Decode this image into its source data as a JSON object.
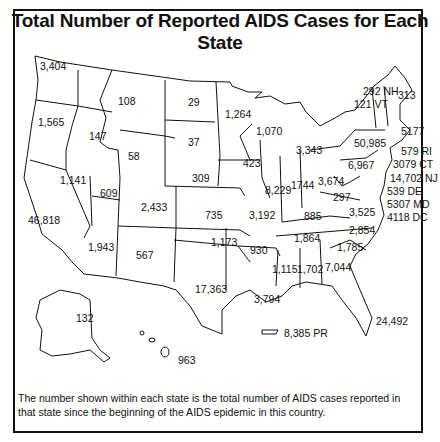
{
  "title": "Total Number of Reported AIDS Cases for Each State",
  "note": "The number shown within each state is the total number of AIDS cases reported in that state since the beginning of the AIDS epidemic in this country.",
  "states": [
    {
      "id": "WA",
      "label": "3,404",
      "x": 40,
      "y": 61
    },
    {
      "id": "OR",
      "label": "1,565",
      "x": 38,
      "y": 117
    },
    {
      "id": "ID",
      "label": "147",
      "x": 89,
      "y": 131
    },
    {
      "id": "MT",
      "label": "108",
      "x": 118,
      "y": 96
    },
    {
      "id": "WY",
      "label": "58",
      "x": 128,
      "y": 151
    },
    {
      "id": "ND",
      "label": "29",
      "x": 188,
      "y": 97
    },
    {
      "id": "SD",
      "label": "37",
      "x": 188,
      "y": 137
    },
    {
      "id": "MN",
      "label": "1,264",
      "x": 225,
      "y": 109
    },
    {
      "id": "WI",
      "label": "1,070",
      "x": 256,
      "y": 126
    },
    {
      "id": "MI",
      "label": "3,343",
      "x": 296,
      "y": 145
    },
    {
      "id": "NV",
      "label": "1,141",
      "x": 60,
      "y": 175
    },
    {
      "id": "UT",
      "label": "609",
      "x": 100,
      "y": 188
    },
    {
      "id": "CO",
      "label": "2,433",
      "x": 141,
      "y": 202
    },
    {
      "id": "NE",
      "label": "309",
      "x": 192,
      "y": 173
    },
    {
      "id": "IA",
      "label": "423",
      "x": 243,
      "y": 158
    },
    {
      "id": "IL",
      "label": "8,229",
      "x": 265,
      "y": 185
    },
    {
      "id": "IN",
      "label": "1744",
      "x": 291,
      "y": 180
    },
    {
      "id": "OH",
      "label": "3,674",
      "x": 318,
      "y": 176
    },
    {
      "id": "PA",
      "label": "6,967",
      "x": 348,
      "y": 160
    },
    {
      "id": "NY",
      "label": "50,985",
      "x": 354,
      "y": 138
    },
    {
      "id": "CA",
      "label": "46,818",
      "x": 28,
      "y": 215
    },
    {
      "id": "KS",
      "label": "735",
      "x": 205,
      "y": 210
    },
    {
      "id": "MO",
      "label": "3,192",
      "x": 249,
      "y": 210
    },
    {
      "id": "KY",
      "label": "885",
      "x": 304,
      "y": 211
    },
    {
      "id": "WV",
      "label": "297",
      "x": 333,
      "y": 192
    },
    {
      "id": "VA",
      "label": "3,525",
      "x": 349,
      "y": 207
    },
    {
      "id": "AZ",
      "label": "1,943",
      "x": 88,
      "y": 242
    },
    {
      "id": "NM",
      "label": "567",
      "x": 136,
      "y": 250
    },
    {
      "id": "OK",
      "label": "1,173",
      "x": 211,
      "y": 237
    },
    {
      "id": "AR",
      "label": "930",
      "x": 250,
      "y": 245
    },
    {
      "id": "TN",
      "label": "1,864",
      "x": 294,
      "y": 233
    },
    {
      "id": "NC",
      "label": "2,854",
      "x": 349,
      "y": 225
    },
    {
      "id": "SC",
      "label": "1,785",
      "x": 337,
      "y": 242
    },
    {
      "id": "TX",
      "label": "17,363",
      "x": 195,
      "y": 284
    },
    {
      "id": "MS",
      "label": "1,115",
      "x": 272,
      "y": 264
    },
    {
      "id": "AL",
      "label": "1,702",
      "x": 297,
      "y": 264
    },
    {
      "id": "GA",
      "label": "7,044",
      "x": 325,
      "y": 262
    },
    {
      "id": "LA",
      "label": "3,794",
      "x": 254,
      "y": 294
    },
    {
      "id": "FL",
      "label": "24,492",
      "x": 376,
      "y": 316
    },
    {
      "id": "AK",
      "label": "132",
      "x": 76,
      "y": 313
    },
    {
      "id": "HI",
      "label": "963",
      "x": 178,
      "y": 355
    },
    {
      "id": "PR",
      "label": "8,385 PR",
      "x": 284,
      "y": 328
    },
    {
      "id": "NH",
      "label": "292 NH",
      "x": 363,
      "y": 86
    },
    {
      "id": "VT",
      "label": "121 VT",
      "x": 354,
      "y": 99
    },
    {
      "id": "ME",
      "label": "313",
      "x": 398,
      "y": 90
    },
    {
      "id": "MA",
      "label": "5177",
      "x": 401,
      "y": 126
    },
    {
      "id": "RI",
      "label": "579 RI",
      "x": 401,
      "y": 146
    },
    {
      "id": "CT",
      "label": "3079 CT",
      "x": 393,
      "y": 159
    },
    {
      "id": "NJ",
      "label": "14,702 NJ",
      "x": 390,
      "y": 173
    },
    {
      "id": "DE",
      "label": "539 DE",
      "x": 387,
      "y": 186
    },
    {
      "id": "MD",
      "label": "5307 MD",
      "x": 387,
      "y": 199
    },
    {
      "id": "DC",
      "label": "4118 DC",
      "x": 387,
      "y": 212
    }
  ]
}
